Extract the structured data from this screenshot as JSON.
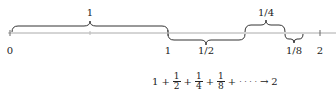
{
  "diagram": {
    "number_line": {
      "ticks": [
        {
          "label": "0",
          "x": 10
        },
        {
          "label": "1",
          "x": 168
        },
        {
          "label": "2",
          "x": 320
        }
      ]
    },
    "braces": [
      {
        "label": "1",
        "from": 12,
        "to": 168,
        "side": "above"
      },
      {
        "label": "1/2",
        "from": 168,
        "to": 245,
        "side": "below"
      },
      {
        "label": "1/4",
        "from": 245,
        "to": 285,
        "side": "above"
      },
      {
        "label": "1/8",
        "from": 285,
        "to": 303,
        "side": "below"
      }
    ],
    "formula": {
      "lead": "1",
      "plus": "+",
      "terms": [
        {
          "num": "1",
          "den": "2"
        },
        {
          "num": "1",
          "den": "4"
        },
        {
          "num": "1",
          "den": "8"
        }
      ],
      "ellipsis": "· · · ·",
      "arrow": "→",
      "limit": "2"
    },
    "colors": {
      "line": "#999999",
      "brace": "#333333",
      "text": "#222222"
    }
  }
}
